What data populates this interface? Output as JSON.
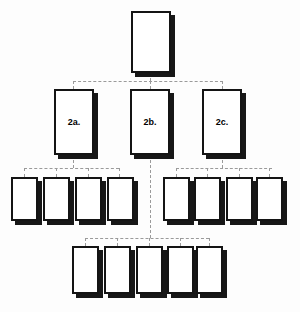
{
  "diagram": {
    "background_color": "#fdfdfd",
    "box_fill_color": "#ffffff",
    "box_border_color": "#141414",
    "box_shadow_color": "#171717",
    "connector_color": "#9a9a9a",
    "connector_style": "dashed"
  },
  "nodes": {
    "root": {
      "label": "",
      "x": 131,
      "y": 11,
      "w": 40,
      "h": 62
    },
    "level2": [
      {
        "label": "2a.",
        "x": 54,
        "y": 89,
        "w": 40,
        "h": 66
      },
      {
        "label": "2b.",
        "x": 130,
        "y": 89,
        "w": 40,
        "h": 66
      },
      {
        "label": "2c.",
        "x": 202,
        "y": 89,
        "w": 40,
        "h": 66
      }
    ],
    "level3_left": [
      {
        "label": "",
        "x": 11,
        "y": 177,
        "w": 27,
        "h": 44
      },
      {
        "label": "",
        "x": 43,
        "y": 177,
        "w": 27,
        "h": 44
      },
      {
        "label": "",
        "x": 75,
        "y": 177,
        "w": 27,
        "h": 44
      },
      {
        "label": "",
        "x": 107,
        "y": 177,
        "w": 27,
        "h": 44
      }
    ],
    "level3_right": [
      {
        "label": "",
        "x": 163,
        "y": 177,
        "w": 27,
        "h": 44
      },
      {
        "label": "",
        "x": 194,
        "y": 177,
        "w": 27,
        "h": 44
      },
      {
        "label": "",
        "x": 226,
        "y": 177,
        "w": 27,
        "h": 44
      },
      {
        "label": "",
        "x": 256,
        "y": 177,
        "w": 27,
        "h": 44
      }
    ],
    "level4": [
      {
        "label": "",
        "x": 72,
        "y": 246,
        "w": 27,
        "h": 48
      },
      {
        "label": "",
        "x": 104,
        "y": 246,
        "w": 27,
        "h": 48
      },
      {
        "label": "",
        "x": 136,
        "y": 246,
        "w": 27,
        "h": 48
      },
      {
        "label": "",
        "x": 167,
        "y": 246,
        "w": 27,
        "h": 48
      },
      {
        "label": "",
        "x": 196,
        "y": 246,
        "w": 27,
        "h": 48
      }
    ]
  },
  "connectors": {
    "root_stem": {
      "x": 150,
      "y": 73,
      "len": 8,
      "orient": "v"
    },
    "level2_bus": {
      "x": 73,
      "y": 81,
      "len": 150,
      "orient": "h"
    },
    "level2_drops": [
      {
        "x": 73,
        "y": 81,
        "len": 8,
        "orient": "v"
      },
      {
        "x": 150,
        "y": 81,
        "len": 8,
        "orient": "v"
      },
      {
        "x": 222,
        "y": 81,
        "len": 8,
        "orient": "v"
      }
    ],
    "level3_left_stem": {
      "x": 73,
      "y": 155,
      "len": 13,
      "orient": "v"
    },
    "level3_left_bus": {
      "x": 24,
      "y": 168,
      "len": 95,
      "orient": "h"
    },
    "level3_left_drops": [
      {
        "x": 24,
        "y": 168,
        "len": 9,
        "orient": "v"
      },
      {
        "x": 56,
        "y": 168,
        "len": 9,
        "orient": "v"
      },
      {
        "x": 88,
        "y": 168,
        "len": 9,
        "orient": "v"
      },
      {
        "x": 119,
        "y": 168,
        "len": 9,
        "orient": "v"
      }
    ],
    "level3_right_stem": {
      "x": 222,
      "y": 155,
      "len": 13,
      "orient": "v"
    },
    "level3_right_bus": {
      "x": 176,
      "y": 168,
      "len": 96,
      "orient": "h"
    },
    "level3_right_drops": [
      {
        "x": 176,
        "y": 168,
        "len": 9,
        "orient": "v"
      },
      {
        "x": 207,
        "y": 168,
        "len": 9,
        "orient": "v"
      },
      {
        "x": 239,
        "y": 168,
        "len": 9,
        "orient": "v"
      },
      {
        "x": 269,
        "y": 168,
        "len": 9,
        "orient": "v"
      }
    ],
    "level4_stem": {
      "x": 150,
      "y": 155,
      "len": 83,
      "orient": "v"
    },
    "level4_bus": {
      "x": 85,
      "y": 238,
      "len": 124,
      "orient": "h"
    },
    "level4_drops": [
      {
        "x": 85,
        "y": 238,
        "len": 8,
        "orient": "v"
      },
      {
        "x": 117,
        "y": 238,
        "len": 8,
        "orient": "v"
      },
      {
        "x": 149,
        "y": 238,
        "len": 8,
        "orient": "v"
      },
      {
        "x": 180,
        "y": 238,
        "len": 8,
        "orient": "v"
      },
      {
        "x": 209,
        "y": 238,
        "len": 8,
        "orient": "v"
      }
    ]
  }
}
